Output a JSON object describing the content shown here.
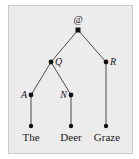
{
  "diagram": {
    "type": "parse-tree",
    "nodes": [
      {
        "id": "root",
        "label": "@",
        "x": 78,
        "y": 30
      },
      {
        "id": "Q",
        "label": "Q",
        "x": 51,
        "y": 62
      },
      {
        "id": "R",
        "label": "R",
        "x": 106,
        "y": 62
      },
      {
        "id": "A",
        "label": "A",
        "x": 31,
        "y": 95
      },
      {
        "id": "N",
        "label": "N",
        "x": 71,
        "y": 95
      },
      {
        "id": "the",
        "label": "The",
        "x": 31,
        "y": 126
      },
      {
        "id": "deer",
        "label": "Deer",
        "x": 71,
        "y": 126
      },
      {
        "id": "graze",
        "label": "Graze",
        "x": 106,
        "y": 126
      }
    ],
    "edges": [
      [
        "root",
        "Q"
      ],
      [
        "root",
        "R"
      ],
      [
        "Q",
        "A"
      ],
      [
        "Q",
        "N"
      ],
      [
        "A",
        "the"
      ],
      [
        "N",
        "deer"
      ],
      [
        "R",
        "graze"
      ]
    ],
    "labels": {
      "root": "@",
      "Q": "Q",
      "R": "R",
      "A": "A",
      "N": "N",
      "leaf_the": "The",
      "leaf_deer": "Deer",
      "leaf_graze": "Graze"
    },
    "colors": {
      "background": "#ececec",
      "ink": "#1a1a1a",
      "edge": "#3a3a3a"
    }
  }
}
